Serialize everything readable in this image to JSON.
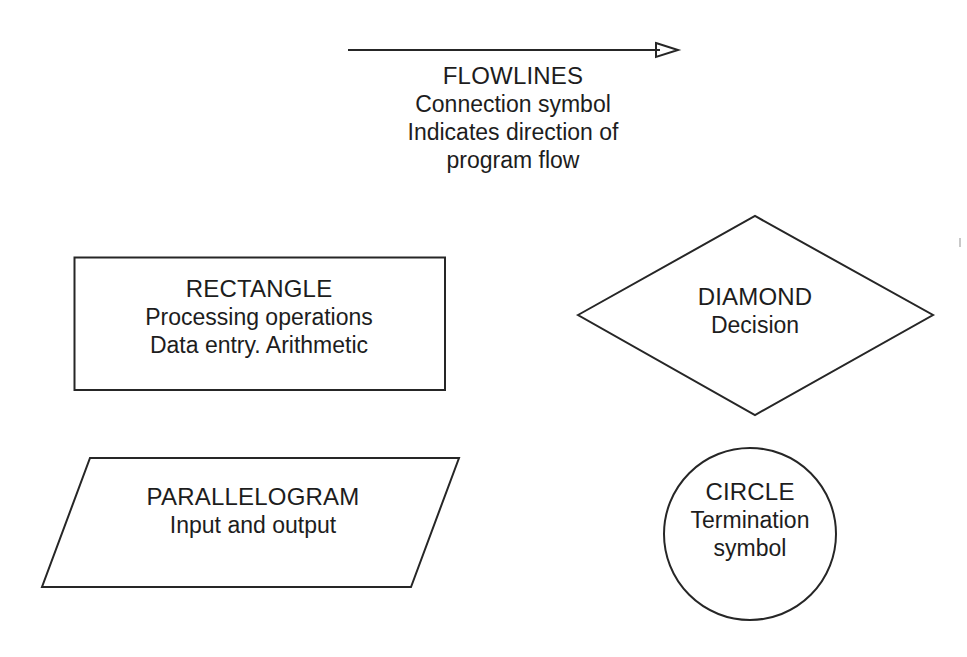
{
  "diagram": {
    "background_color": "#ffffff",
    "stroke_color": "#262626",
    "text_color": "#1d1d1d"
  },
  "symbols": {
    "flowlines": {
      "name": "FLOWLINES",
      "icon": "right-arrow-icon",
      "lines": [
        "Connection symbol",
        "Indicates direction of",
        "program flow"
      ],
      "arrow": {
        "x1": 2,
        "y1": 12,
        "x2": 318,
        "y2": 12,
        "tip_x": 332,
        "head_width": 22,
        "head_height": 13
      }
    },
    "rectangle": {
      "name": "RECTANGLE",
      "shape": "rectangle",
      "lines": [
        "Processing operations",
        "Data entry. Arithmetic"
      ],
      "geometry": {
        "width": 370,
        "height": 133
      }
    },
    "diamond": {
      "name": "DIAMOND",
      "shape": "diamond",
      "lines": [
        "Decision"
      ],
      "geometry": {
        "width": 356,
        "height": 200
      }
    },
    "parallelogram": {
      "name": "PARALLELOGRAM",
      "shape": "parallelogram",
      "lines": [
        "Input and output"
      ],
      "geometry": {
        "width": 417,
        "height": 129,
        "skew": 48
      }
    },
    "circle": {
      "name": "CIRCLE",
      "shape": "circle",
      "lines": [
        "Termination",
        "symbol"
      ],
      "geometry": {
        "radius": 86
      }
    }
  }
}
